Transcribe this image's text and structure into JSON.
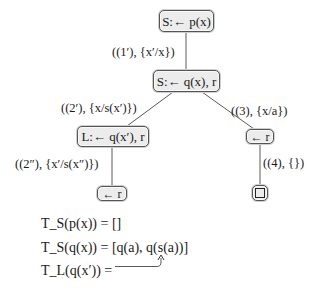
{
  "diagram": {
    "type": "sld-resolution-tree",
    "nodes": [
      {
        "id": "n1",
        "label": "S:← p(x)"
      },
      {
        "id": "n2",
        "label": "S:← q(x), r"
      },
      {
        "id": "n3",
        "label": "L:← q(x′), r"
      },
      {
        "id": "n4",
        "label": "← r"
      },
      {
        "id": "n5",
        "label": "← r"
      },
      {
        "id": "n6",
        "label": "□"
      }
    ],
    "edges": [
      {
        "from": "n1",
        "to": "n2",
        "label": "((1′), {x′/x})"
      },
      {
        "from": "n2",
        "to": "n3",
        "label": "((2′), {x/s(x′)})"
      },
      {
        "from": "n2",
        "to": "n4",
        "label": "((3), {x/a})"
      },
      {
        "from": "n3",
        "to": "n5",
        "label": "((2″), {x′/s(x″)})"
      },
      {
        "from": "n4",
        "to": "n6",
        "label": "((4), {})"
      }
    ],
    "equations": [
      {
        "lhs": "T_S(p(x)) =",
        "rhs": "[]"
      },
      {
        "lhs": "T_S(q(x)) =",
        "rhs": "[q(a), q(s(a))]"
      },
      {
        "lhs": "T_L(q(x′)) =",
        "rhs": "",
        "arrow_to": "q(s(a))"
      }
    ],
    "colors": {
      "node_fill": "#ececec",
      "node_border": "#555555",
      "edge": "#555555",
      "text": "#1a1a1a"
    }
  }
}
